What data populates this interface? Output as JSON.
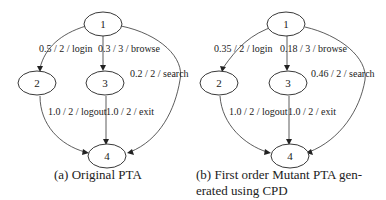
{
  "figure_a": {
    "caption": "(a) Original PTA",
    "nodes": {
      "n1": "1",
      "n2": "2",
      "n3": "3",
      "n4": "4"
    },
    "edges": {
      "e12": "0.5 / 2 / login",
      "e13": "0.3 / 3 / browse",
      "e14": "0.2 / 2 / search",
      "e24": "1.0 / 2 / logout",
      "e34": "1.0 / 2 / exit"
    }
  },
  "figure_b": {
    "caption_line1": "(b) First order Mutant PTA gen-",
    "caption_line2": "erated using CPD",
    "nodes": {
      "n1": "1",
      "n2": "2",
      "n3": "3",
      "n4": "4"
    },
    "edges": {
      "e12": "0.35 / 2 / login",
      "e13": "0.18 / 3 / browse",
      "e14": "0.46 / 2 / search",
      "e24": "1.0 / 2 / logout",
      "e34": "1.0 / 2 / exit"
    }
  }
}
